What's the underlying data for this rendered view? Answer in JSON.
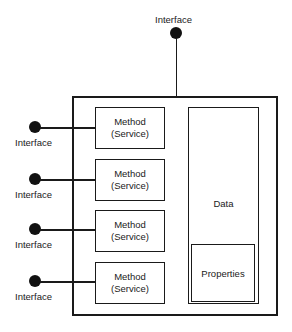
{
  "diagram": {
    "title": "",
    "top_interface": {
      "label": "Interface"
    },
    "side_interfaces": [
      {
        "label": "Interface"
      },
      {
        "label": "Interface"
      },
      {
        "label": "Interface"
      },
      {
        "label": "Interface"
      }
    ],
    "methods": [
      {
        "line1": "Method",
        "line2": "(Service)"
      },
      {
        "line1": "Method",
        "line2": "(Service)"
      },
      {
        "line1": "Method",
        "line2": "(Service)"
      },
      {
        "line1": "Method",
        "line2": "(Service)"
      }
    ],
    "data": {
      "label": "Data"
    },
    "properties": {
      "label": "Properties"
    }
  }
}
